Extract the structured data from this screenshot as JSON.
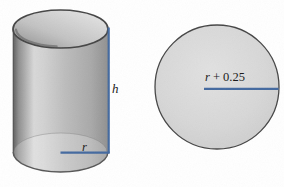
{
  "labels": {
    "cylinder_height": "h",
    "cylinder_radius": "r",
    "circle_radius_variable": "r",
    "circle_radius_offset": "+ 0.25"
  },
  "colors": {
    "dimension_line": "#43699f",
    "shape_outline": "#454545",
    "label_ink": "#1c1c1c",
    "background": "#ffffff"
  }
}
